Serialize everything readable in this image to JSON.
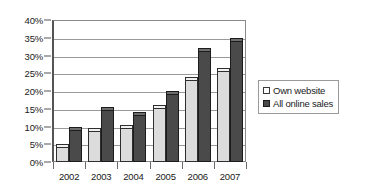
{
  "chart_data": {
    "type": "bar",
    "title": "",
    "xlabel": "",
    "ylabel": "",
    "categories": [
      "2002",
      "2003",
      "2004",
      "2005",
      "2006",
      "2007"
    ],
    "series": [
      {
        "name": "Own website",
        "color": "#dcdcdc",
        "values": [
          5,
          9.5,
          10.5,
          16,
          24,
          26.5
        ]
      },
      {
        "name": "All online sales",
        "color": "#4a4a4a",
        "values": [
          10,
          15.5,
          14,
          20,
          32,
          35
        ]
      }
    ],
    "ylim": [
      0,
      40
    ],
    "ytick_step": 5,
    "ytick_labels": [
      "0%",
      "5%",
      "10%",
      "15%",
      "20%",
      "25%",
      "30%",
      "35%",
      "40%"
    ],
    "ytick_values": [
      0,
      5,
      10,
      15,
      20,
      25,
      30,
      35,
      40
    ],
    "grid": true,
    "legend_position": "right"
  },
  "legend": {
    "entries": [
      {
        "label": "Own website",
        "swatch": "own"
      },
      {
        "label": "All online sales",
        "swatch": "all"
      }
    ]
  }
}
